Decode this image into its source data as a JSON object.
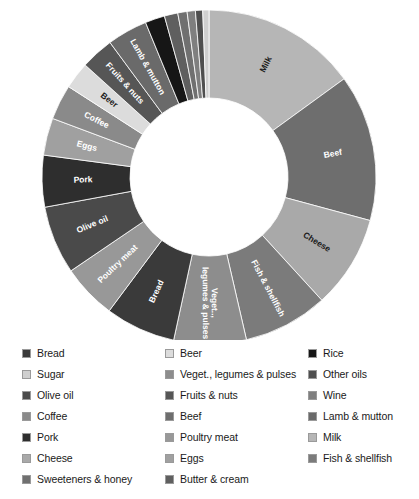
{
  "chart_data": {
    "type": "pie",
    "variant": "donut",
    "title": "",
    "subtitle": "",
    "xlabel": "",
    "ylabel": "",
    "grid": false,
    "legend_position": "bottom",
    "legend_columns": 3,
    "start_angle_deg": 0,
    "direction": "clockwise",
    "inner_radius_ratio": 0.47,
    "labels_on_slices": true,
    "categories": [
      "Milk",
      "Beef",
      "Cheese",
      "Fish & shellfish",
      "Veget., legumes & pulses",
      "Bread",
      "Poultry meat",
      "Olive oil",
      "Pork",
      "Eggs",
      "Coffee",
      "Beer",
      "Fruits & nuts",
      "Lamb & mutton",
      "Rice",
      "Butter & cream",
      "Sweeteners & honey",
      "Wine",
      "Other oils",
      "Sugar"
    ],
    "values": [
      15.0,
      14.2,
      9.0,
      8.2,
      7.0,
      6.8,
      5.3,
      6.6,
      5.0,
      3.6,
      3.4,
      2.6,
      3.2,
      3.9,
      1.9,
      1.3,
      0.9,
      0.8,
      0.7,
      0.6
    ],
    "unit": "percent",
    "slice_label_visible": [
      "Milk",
      "Beef",
      "Cheese",
      "Fish & shellfish",
      "Veget., legumes & pulses",
      "Bread",
      "Poultry meat",
      "Olive oil",
      "Pork",
      "Eggs",
      "Coffee",
      "Beer",
      "Fruits & nuts",
      "Lamb & mutton"
    ]
  },
  "palette": {
    "Milk": "#b6b6b6",
    "Beef": "#6e6e6e",
    "Cheese": "#a9a9a9",
    "Fish & shellfish": "#7b7b7b",
    "Veget., legumes & pulses": "#8d8d8d",
    "Bread": "#3a3a3a",
    "Poultry meat": "#989898",
    "Olive oil": "#4a4a4a",
    "Pork": "#2e2e2e",
    "Eggs": "#a0a0a0",
    "Coffee": "#8a8a8a",
    "Beer": "#dcdcdc",
    "Fruits & nuts": "#565656",
    "Lamb & mutton": "#6a6a6a",
    "Rice": "#161616",
    "Butter & cream": "#5f5f5f",
    "Sweeteners & honey": "#707070",
    "Wine": "#7f7f7f",
    "Other oils": "#4f4f4f",
    "Sugar": "#cfcfcf"
  },
  "legend": {
    "items": [
      {
        "label": "Bread",
        "color": "#3a3a3a"
      },
      {
        "label": "Beer",
        "color": "#dcdcdc"
      },
      {
        "label": "Rice",
        "color": "#161616"
      },
      {
        "label": "Sugar",
        "color": "#cfcfcf"
      },
      {
        "label": "Veget., legumes & pulses",
        "color": "#8d8d8d"
      },
      {
        "label": "Other oils",
        "color": "#4f4f4f"
      },
      {
        "label": "Olive oil",
        "color": "#4a4a4a"
      },
      {
        "label": "Fruits & nuts",
        "color": "#565656"
      },
      {
        "label": "Wine",
        "color": "#7f7f7f"
      },
      {
        "label": "Coffee",
        "color": "#8a8a8a"
      },
      {
        "label": "Beef",
        "color": "#6e6e6e"
      },
      {
        "label": "Lamb & mutton",
        "color": "#6a6a6a"
      },
      {
        "label": "Pork",
        "color": "#2e2e2e"
      },
      {
        "label": "Poultry meat",
        "color": "#989898"
      },
      {
        "label": "Milk",
        "color": "#b6b6b6"
      },
      {
        "label": "Cheese",
        "color": "#a9a9a9"
      },
      {
        "label": "Eggs",
        "color": "#a0a0a0"
      },
      {
        "label": "Fish & shellfish",
        "color": "#7b7b7b"
      },
      {
        "label": "Sweeteners & honey",
        "color": "#707070"
      },
      {
        "label": "Butter & cream",
        "color": "#5f5f5f"
      }
    ]
  },
  "geometry": {
    "cx": 209,
    "cy": 177,
    "outer_r": 167,
    "inner_r": 79,
    "label_r": 126
  }
}
